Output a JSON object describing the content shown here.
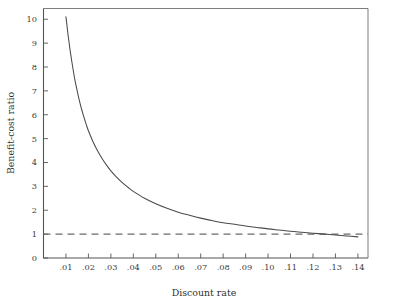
{
  "figure": {
    "background_color": "#ffffff",
    "line_color": "#4a4a4a",
    "reference_line_color": "#6a6a6a",
    "axis_color": "#555555"
  },
  "chart_data": {
    "type": "line",
    "title": "",
    "subtitle": "",
    "xlabel": "Discount rate",
    "ylabel": "Benefit-cost ratio",
    "xlim": [
      0.0,
      0.1445
    ],
    "ylim": [
      0,
      10.45
    ],
    "grid": false,
    "legend": null,
    "x_tick_labels": [
      ".01",
      ".02",
      ".03",
      ".04",
      ".05",
      ".06",
      ".07",
      ".08",
      ".09",
      ".10",
      ".11",
      ".12",
      ".13",
      ".14"
    ],
    "x_tick_values": [
      0.01,
      0.02,
      0.03,
      0.04,
      0.05,
      0.06,
      0.07,
      0.08,
      0.09,
      0.1,
      0.11,
      0.12,
      0.13,
      0.14
    ],
    "y_tick_labels": [
      "0",
      "1",
      "2",
      "3",
      "4",
      "5",
      "6",
      "7",
      "8",
      "9",
      "10"
    ],
    "y_tick_values": [
      0,
      1,
      2,
      3,
      4,
      5,
      6,
      7,
      8,
      9,
      10
    ],
    "series": [
      {
        "name": "Benefit-cost ratio",
        "style": "solid",
        "x": [
          0.01,
          0.0105,
          0.011,
          0.0115,
          0.012,
          0.013,
          0.014,
          0.015,
          0.016,
          0.017,
          0.018,
          0.019,
          0.02,
          0.022,
          0.024,
          0.026,
          0.028,
          0.03,
          0.032,
          0.034,
          0.036,
          0.038,
          0.04,
          0.045,
          0.05,
          0.055,
          0.06,
          0.065,
          0.07,
          0.075,
          0.08,
          0.085,
          0.09,
          0.095,
          0.1,
          0.105,
          0.11,
          0.115,
          0.12,
          0.125,
          0.13,
          0.135,
          0.14
        ],
        "y": [
          10.1,
          9.7,
          9.3,
          8.95,
          8.6,
          8.0,
          7.45,
          7.0,
          6.58,
          6.22,
          5.9,
          5.6,
          5.33,
          4.88,
          4.5,
          4.18,
          3.9,
          3.65,
          3.44,
          3.25,
          3.08,
          2.93,
          2.79,
          2.5,
          2.27,
          2.08,
          1.92,
          1.79,
          1.67,
          1.57,
          1.48,
          1.41,
          1.34,
          1.28,
          1.22,
          1.17,
          1.12,
          1.08,
          1.04,
          1.0,
          0.965,
          0.925,
          0.885
        ]
      },
      {
        "name": "break-even reference",
        "style": "dashed",
        "constant_y": 1.0,
        "x": [
          0.0,
          0.1445
        ],
        "y": [
          1.0,
          1.0
        ]
      }
    ],
    "annotations": []
  }
}
